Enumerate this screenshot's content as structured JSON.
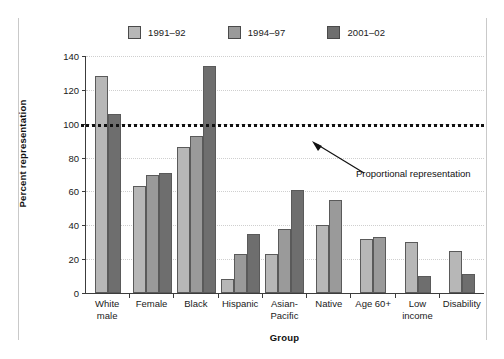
{
  "chart_data": {
    "type": "bar",
    "title": "",
    "xlabel": "Group",
    "ylabel": "Percent representation",
    "ylim": [
      0,
      140
    ],
    "yticks": [
      0,
      20,
      40,
      60,
      80,
      100,
      120,
      140
    ],
    "grid": true,
    "legend_position": "top",
    "categories": [
      "White male",
      "Female",
      "Black",
      "Hispanic",
      "Asian-Pacific",
      "Native",
      "Age 60+",
      "Low income",
      "Disability"
    ],
    "category_lines": [
      [
        "White",
        "male"
      ],
      [
        "Female"
      ],
      [
        "Black"
      ],
      [
        "Hispanic"
      ],
      [
        "Asian-",
        "Pacific"
      ],
      [
        "Native"
      ],
      [
        "Age 60+"
      ],
      [
        "Low",
        "income"
      ],
      [
        "Disability"
      ]
    ],
    "series": [
      {
        "name": "1991–92",
        "color": "#b7b7b7",
        "values": [
          128,
          63,
          86,
          8,
          23,
          40,
          32,
          30,
          25
        ]
      },
      {
        "name": "1994–97",
        "color": "#9a9a9a",
        "values": [
          null,
          70,
          93,
          23,
          38,
          55,
          33,
          null,
          null
        ]
      },
      {
        "name": "2001–02",
        "color": "#6e6e6e",
        "values": [
          106,
          71,
          134,
          35,
          61,
          null,
          null,
          10,
          11
        ]
      }
    ],
    "reference_line": {
      "value": 100,
      "label": "Proportional representation",
      "style": "dotted"
    }
  }
}
